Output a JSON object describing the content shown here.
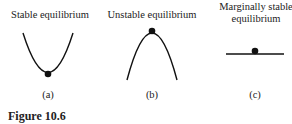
{
  "figure": {
    "caption": "Figure 10.6",
    "panels": [
      {
        "title_line1": "Stable equilibrium",
        "title_line2": "",
        "sublabel": "(a)",
        "shape": "valley"
      },
      {
        "title_line1": "Unstable equilibrium",
        "title_line2": "",
        "sublabel": "(b)",
        "shape": "hill"
      },
      {
        "title_line1": "Marginally stable",
        "title_line2": "equilibrium",
        "sublabel": "(c)",
        "shape": "flat"
      }
    ]
  },
  "colors": {
    "ink": "#111111",
    "text": "#222222"
  }
}
